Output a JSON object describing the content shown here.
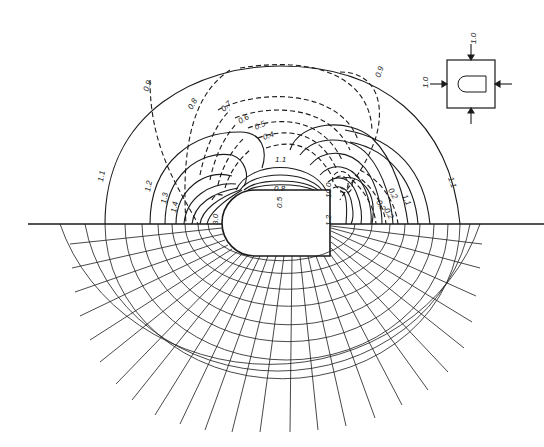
{
  "diagram": {
    "type": "stress-contour / photoelastic-style field around a rounded-end opening",
    "upper_half": "isochromatic (solid) and isoclinic/principal stress (dashed) contours",
    "lower_half": "orthogonal stress trajectory mesh"
  },
  "solid_contour_labels": [
    {
      "text": "1.1",
      "x": 103,
      "y": 182,
      "rot": -80
    },
    {
      "text": "1.2",
      "x": 150,
      "y": 192,
      "rot": -80
    },
    {
      "text": "1.3",
      "x": 166,
      "y": 204,
      "rot": -80
    },
    {
      "text": "1.4",
      "x": 176,
      "y": 213,
      "rot": -80
    },
    {
      "text": "1.1",
      "x": 275,
      "y": 162,
      "rot": 0
    },
    {
      "text": "0.8",
      "x": 274,
      "y": 191,
      "rot": 0
    },
    {
      "text": "1.1",
      "x": 448,
      "y": 178,
      "rot": 70
    },
    {
      "text": "1.1",
      "x": 402,
      "y": 196,
      "rot": 65
    }
  ],
  "dashed_contour_labels": [
    {
      "text": "0.9",
      "x": 148,
      "y": 92,
      "rot": -70
    },
    {
      "text": "0.8",
      "x": 192,
      "y": 110,
      "rot": -60
    },
    {
      "text": "0.7",
      "x": 224,
      "y": 112,
      "rot": -45
    },
    {
      "text": "0.6",
      "x": 240,
      "y": 124,
      "rot": -30
    },
    {
      "text": "0.5",
      "x": 256,
      "y": 130,
      "rot": -25
    },
    {
      "text": "0.4",
      "x": 264,
      "y": 140,
      "rot": -20
    },
    {
      "text": "0.9",
      "x": 380,
      "y": 78,
      "rot": -70
    },
    {
      "text": "0.2",
      "x": 388,
      "y": 190,
      "rot": 60
    },
    {
      "text": "0.2",
      "x": 376,
      "y": 202,
      "rot": 60
    },
    {
      "text": "0.2",
      "x": 384,
      "y": 210,
      "rot": 60
    }
  ],
  "boundary_labels": [
    {
      "text": "3.0",
      "x": 218,
      "y": 225,
      "rot": -90
    },
    {
      "text": "0.5",
      "x": 282,
      "y": 208,
      "rot": -90
    },
    {
      "text": "1.2",
      "x": 331,
      "y": 226,
      "rot": -90
    },
    {
      "text": "10.0",
      "x": 331,
      "y": 198,
      "rot": -90
    }
  ],
  "inset": {
    "label_top": "1.0",
    "label_left": "1.0",
    "description": "square plate with rounded-end slot, uniform load 1.0 on all sides"
  },
  "colors": {
    "ink": "#1a1a1a",
    "background": "#ffffff"
  }
}
